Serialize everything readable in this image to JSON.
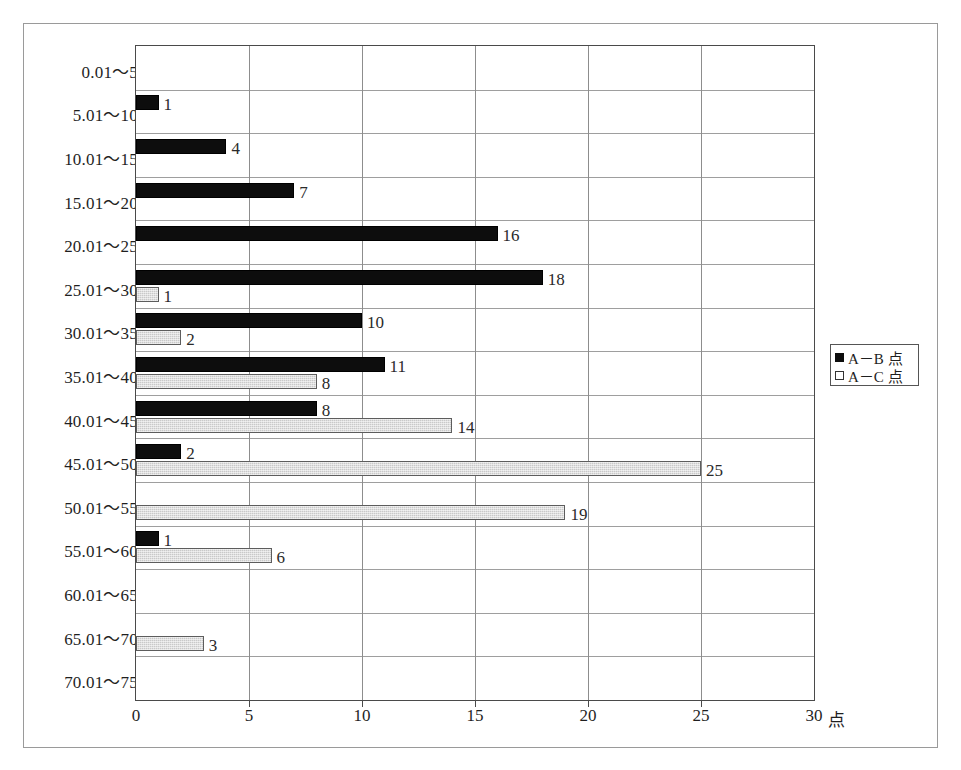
{
  "chart_data": {
    "type": "bar",
    "orientation": "horizontal",
    "title": "",
    "xlabel": "",
    "ylabel": "",
    "x_unit": "点",
    "xlim": [
      0,
      30
    ],
    "xticks": [
      0,
      5,
      10,
      15,
      20,
      25,
      30
    ],
    "xtick_labels": [
      "0",
      "5",
      "10",
      "15",
      "20",
      "25",
      "30"
    ],
    "grid": true,
    "legend_position": "right",
    "categories": [
      "0.01～5",
      "5.01～10",
      "10.01～15",
      "15.01～20",
      "20.01～25",
      "25.01～30",
      "30.01～35",
      "35.01～40",
      "40.01～45",
      "45.01～50",
      "50.01～55",
      "55.01～60",
      "60.01～65",
      "65.01～70",
      "70.01～75"
    ],
    "series": [
      {
        "name": "A－B 点",
        "color": "#0d0d0d",
        "values": [
          0,
          1,
          4,
          7,
          16,
          18,
          10,
          11,
          8,
          2,
          0,
          1,
          0,
          0,
          0
        ],
        "labels": [
          "",
          "1",
          "4",
          "7",
          "16",
          "18",
          "10",
          "11",
          "8",
          "2",
          "",
          "1",
          "",
          "",
          ""
        ]
      },
      {
        "name": "A－C 点",
        "color": "#c9c9c9",
        "values": [
          0,
          0,
          0,
          0,
          0,
          1,
          2,
          8,
          14,
          25,
          19,
          6,
          0,
          3,
          0
        ],
        "labels": [
          "",
          "",
          "",
          "",
          "",
          "1",
          "2",
          "8",
          "14",
          "25",
          "19",
          "6",
          "",
          "3",
          ""
        ]
      }
    ]
  },
  "legend": {
    "entries": [
      {
        "label": "A－B 点",
        "marker": "filled-square"
      },
      {
        "label": "A－C 点",
        "marker": "hollow-square"
      }
    ]
  }
}
